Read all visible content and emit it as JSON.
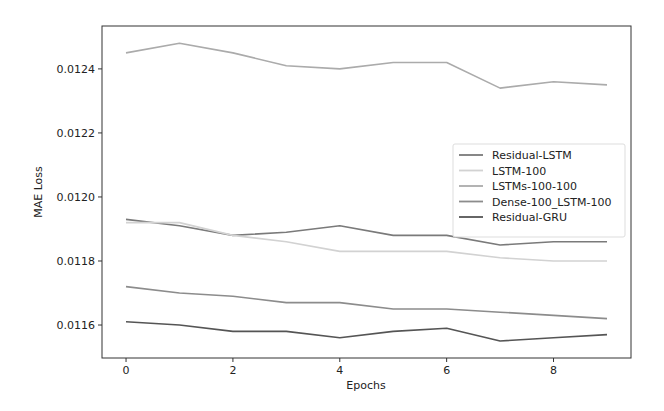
{
  "chart_data": {
    "type": "line",
    "title": "",
    "xlabel": "Epochs",
    "ylabel": "MAE Loss",
    "x": [
      0,
      1,
      2,
      3,
      4,
      5,
      6,
      7,
      8,
      9
    ],
    "xlim": [
      -0.45,
      9.45
    ],
    "ylim": [
      0.011497,
      0.012534
    ],
    "xticks": [
      0,
      2,
      4,
      6,
      8
    ],
    "xtick_labels": [
      "0",
      "2",
      "4",
      "6",
      "8"
    ],
    "yticks": [
      0.0116,
      0.0118,
      0.012,
      0.0122,
      0.0124
    ],
    "ytick_labels": [
      "0.0116",
      "0.0118",
      "0.0120",
      "0.0122",
      "0.0124"
    ],
    "grid": false,
    "legend_position": "center right",
    "series": [
      {
        "name": "Residual-LSTM",
        "color": "#7a7a7a",
        "values": [
          0.01193,
          0.01191,
          0.01188,
          0.01189,
          0.01191,
          0.01188,
          0.01188,
          0.01185,
          0.01186,
          0.01186
        ]
      },
      {
        "name": "LSTM-100",
        "color": "#d2d2d2",
        "values": [
          0.01192,
          0.01192,
          0.01188,
          0.01186,
          0.01183,
          0.01183,
          0.01183,
          0.01181,
          0.0118,
          0.0118
        ]
      },
      {
        "name": "LSTMs-100-100",
        "color": "#ababab",
        "values": [
          0.01245,
          0.01248,
          0.01245,
          0.01241,
          0.0124,
          0.01242,
          0.01242,
          0.01234,
          0.01236,
          0.01235
        ]
      },
      {
        "name": "Dense-100_LSTM-100",
        "color": "#8c8c8c",
        "values": [
          0.01172,
          0.0117,
          0.01169,
          0.01167,
          0.01167,
          0.01165,
          0.01165,
          0.01164,
          0.01163,
          0.01162
        ]
      },
      {
        "name": "Residual-GRU",
        "color": "#555555",
        "values": [
          0.01161,
          0.0116,
          0.01158,
          0.01158,
          0.01156,
          0.01158,
          0.01159,
          0.01155,
          0.01156,
          0.01157
        ]
      }
    ]
  }
}
